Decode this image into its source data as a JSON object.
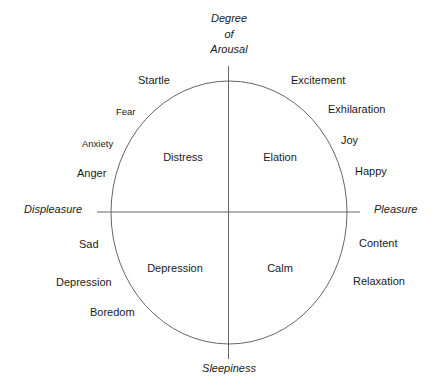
{
  "diagram": {
    "type": "circumplex",
    "axes": {
      "top": [
        "Degree",
        "of",
        "Arousal"
      ],
      "bottom": "Sleepiness",
      "left": "Displeasure",
      "right": "Pleasure"
    },
    "quadrants": {
      "top_left": "Distress",
      "top_right": "Elation",
      "bottom_left": "Depression",
      "bottom_right": "Calm"
    },
    "outer_labels": {
      "upper_left": [
        "Startle",
        "Fear",
        "Anxiety",
        "Anger"
      ],
      "upper_right": [
        "Excitement",
        "Exhilaration",
        "Joy",
        "Happy"
      ],
      "lower_left": [
        "Sad",
        "Depression",
        "Boredom"
      ],
      "lower_right": [
        "Content",
        "Relaxation"
      ]
    },
    "colors": {
      "line": "#555555",
      "text": "#1a1a1a",
      "background": "#ffffff"
    }
  }
}
